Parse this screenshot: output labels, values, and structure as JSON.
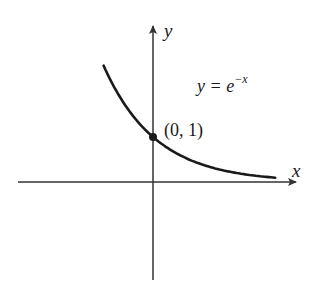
{
  "chart_data": {
    "type": "line",
    "title": "",
    "xlabel": "x",
    "ylabel": "y",
    "function": "y = e^{-x}",
    "annotations": [
      {
        "text": "y = e^{-x}",
        "role": "equation-label"
      },
      {
        "text": "(0, 1)",
        "role": "point-label",
        "x": 0,
        "y": 1
      }
    ],
    "highlighted_point": {
      "x": 0,
      "y": 1
    },
    "series": [
      {
        "name": "y = e^-x",
        "x": [
          -0.95,
          -0.75,
          -0.5,
          -0.25,
          0,
          0.25,
          0.5,
          0.75,
          1.0,
          1.25,
          1.5,
          1.75,
          2.0,
          2.35
        ],
        "values": [
          2.59,
          2.12,
          1.65,
          1.28,
          1.0,
          0.78,
          0.61,
          0.47,
          0.37,
          0.29,
          0.22,
          0.17,
          0.14,
          0.1
        ]
      }
    ],
    "grid": false,
    "legend": "none",
    "ticks": "none"
  },
  "labels": {
    "x_axis": "x",
    "y_axis": "y",
    "equation_base": "y = e",
    "equation_exponent": "−x",
    "point": "(0, 1)"
  },
  "colors": {
    "curve": "#1a1a1a",
    "axes": "#333333",
    "background": "#ffffff"
  }
}
